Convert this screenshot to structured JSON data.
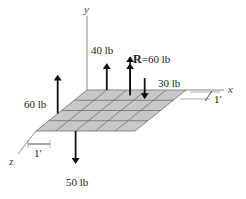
{
  "colors": {
    "plate_fill": "#c8c8c8",
    "grid_line": "#6e6e6e",
    "axis": "#8a8a8a",
    "arrow": "#111111"
  },
  "axes": {
    "x": "x",
    "y": "y",
    "z": "z"
  },
  "grid": {
    "columns": 5,
    "rows": 4,
    "cell_size_label": "1′"
  },
  "dimension_labels": {
    "x_side": "1′",
    "z_side": "1′"
  },
  "forces": [
    {
      "id": "f40",
      "label": "40 lb",
      "magnitude": 40,
      "unit": "lb",
      "direction": "up",
      "x": 1,
      "z": 0
    },
    {
      "id": "fR",
      "label_bold": "R",
      "label_rest": "=60 lb",
      "magnitude": 60,
      "unit": "lb",
      "direction": "up",
      "x": 2.5,
      "z": 0.5,
      "resultant": true
    },
    {
      "id": "f30",
      "label": "30 lb",
      "magnitude": 30,
      "unit": "lb",
      "direction": "down",
      "x": 3.3,
      "z": 0.6
    },
    {
      "id": "f60",
      "label": "60 lb",
      "magnitude": 60,
      "unit": "lb",
      "direction": "up",
      "x": 0,
      "z": 2.3
    },
    {
      "id": "f50",
      "label": "50 lb",
      "magnitude": 50,
      "unit": "lb",
      "direction": "down",
      "x": 2,
      "z": 4
    }
  ]
}
